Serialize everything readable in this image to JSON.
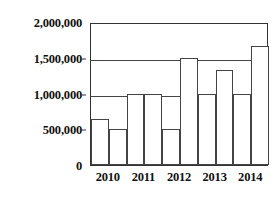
{
  "chart_data": {
    "type": "bar",
    "title": "",
    "xlabel": "",
    "ylabel": "",
    "categories": [
      "2010",
      "2011",
      "2012",
      "2013",
      "2014"
    ],
    "ylim": [
      0,
      2000000
    ],
    "ytick_values": [
      0,
      500000,
      1000000,
      1500000,
      2000000
    ],
    "ytick_labels": [
      "0",
      "500,000",
      "1,000,000",
      "1,500,000",
      "2,000,000"
    ],
    "grid": true,
    "legend": "none",
    "series": [
      {
        "name": "series-1",
        "values": [
          650000,
          1000000,
          500000,
          1000000,
          1000000
        ]
      },
      {
        "name": "series-2",
        "values": [
          500000,
          1000000,
          1500000,
          1330000,
          1670000
        ]
      }
    ],
    "bars": [
      {
        "category": "2010",
        "series": "series-1",
        "value": 650000
      },
      {
        "category": "2010",
        "series": "series-2",
        "value": 500000
      },
      {
        "category": "2011",
        "series": "series-1",
        "value": 1000000
      },
      {
        "category": "2011",
        "series": "series-2",
        "value": 1000000
      },
      {
        "category": "2012",
        "series": "series-1",
        "value": 500000
      },
      {
        "category": "2012",
        "series": "series-2",
        "value": 1500000
      },
      {
        "category": "2013",
        "series": "series-1",
        "value": 1000000
      },
      {
        "category": "2013",
        "series": "series-2",
        "value": 1330000
      },
      {
        "category": "2014",
        "series": "series-1",
        "value": 1000000
      },
      {
        "category": "2014",
        "series": "series-2",
        "value": 1670000
      }
    ],
    "colors": {
      "bar_fill": "#ffffff",
      "bar_stroke": "#444444",
      "axis": "#333333",
      "grid": "#444444",
      "text": "#111111",
      "background": "#ffffff"
    }
  }
}
